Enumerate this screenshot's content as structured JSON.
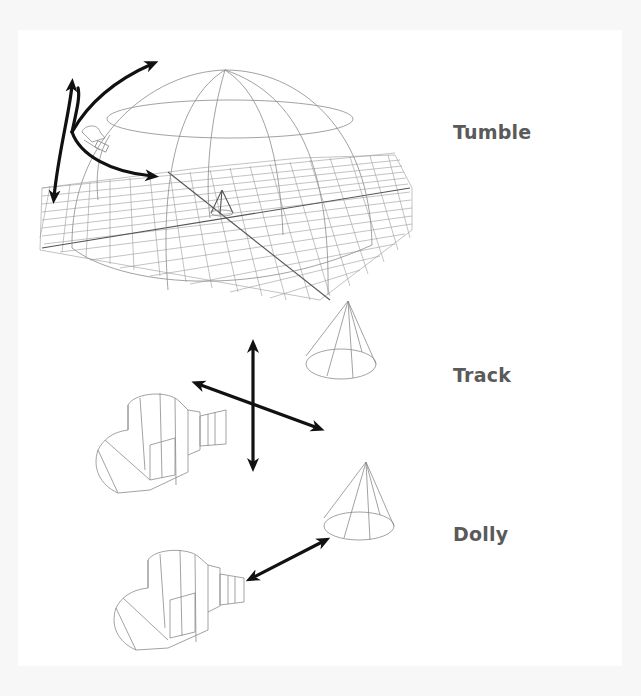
{
  "figure": {
    "background": "#f7f7f7",
    "panel_background": "#ffffff",
    "label_color": "#5a5a5a",
    "arrow_color": "#111111",
    "wireframe_color": "#8a8a8a"
  },
  "sections": [
    {
      "id": "tumble",
      "label": "Tumble",
      "description_icons": [
        "wireframe-hemisphere",
        "grid-plane",
        "small-cone",
        "small-camera",
        "curved-double-arrows"
      ]
    },
    {
      "id": "track",
      "label": "Track",
      "description_icons": [
        "wireframe-camera",
        "wireframe-cone",
        "cross-double-arrows"
      ]
    },
    {
      "id": "dolly",
      "label": "Dolly",
      "description_icons": [
        "wireframe-camera",
        "wireframe-cone",
        "diagonal-double-arrow"
      ]
    }
  ]
}
